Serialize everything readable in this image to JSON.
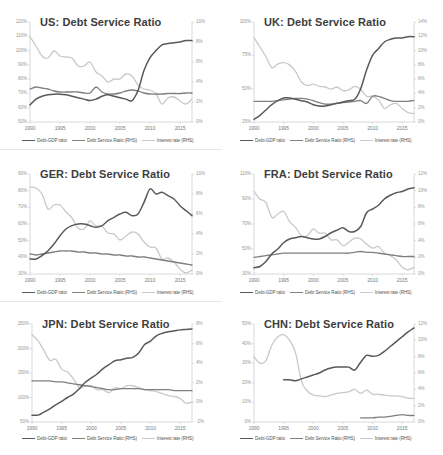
{
  "figure": {
    "panel_count": 6,
    "series_names": [
      "Debt-GDP ratio",
      "Debt Service Ratio (RHS)",
      "Interest rate (RHS)"
    ],
    "colors": {
      "debt_gdp": "#595959",
      "debt_service": "#7f7f7f",
      "interest_rate": "#c9c9c9",
      "axis": "#c9c9c9",
      "tick_text": "#9a9a9a",
      "title_text": "#3d3d3d",
      "background": "#ffffff"
    },
    "legend": {
      "position": "bottom",
      "item1": "Debt-GDP ratio",
      "item2": "Debt Service Ratio (RHS)",
      "item3": "Interest rate (RHS)"
    },
    "xticks": [
      "1990",
      "1995",
      "2000",
      "2005",
      "2010",
      "2015"
    ]
  },
  "chart_data": [
    {
      "type": "line",
      "id": "us",
      "title": "US: Debt Service Ratio",
      "xlabel": "",
      "ylabel": "",
      "grid": false,
      "legend_position": "bottom",
      "xlim": [
        1990,
        2017
      ],
      "xticks": [
        "1990",
        "1995",
        "2000",
        "2005",
        "2010",
        "2015"
      ],
      "ylim_left": [
        50,
        120
      ],
      "yticks_left": [
        "120%",
        "110%",
        "100%",
        "90%",
        "80%",
        "70%",
        "60%",
        "50%"
      ],
      "ylim_right": [
        0,
        10
      ],
      "yticks_right": [
        "10%",
        "8%",
        "6%",
        "4%",
        "2%",
        "0%"
      ],
      "x": [
        1990,
        1991,
        1992,
        1993,
        1994,
        1995,
        1996,
        1997,
        1998,
        1999,
        2000,
        2001,
        2002,
        2003,
        2004,
        2005,
        2006,
        2007,
        2008,
        2009,
        2010,
        2011,
        2012,
        2013,
        2014,
        2015,
        2016,
        2017
      ],
      "series": [
        {
          "name": "Debt-GDP ratio",
          "axis": "left",
          "color": "#595959",
          "values": [
            62,
            66,
            68,
            69,
            69.5,
            69.5,
            69,
            68,
            67,
            66,
            65,
            66,
            68,
            69,
            68,
            67,
            66,
            65,
            72,
            86,
            95,
            100,
            104,
            105,
            105.5,
            106,
            107,
            107
          ]
        },
        {
          "name": "Debt Service Ratio (RHS)",
          "axis": "right",
          "color": "#7f7f7f",
          "values": [
            3.3,
            3.5,
            3.4,
            3.3,
            3.1,
            3.0,
            3.0,
            3.0,
            3.0,
            2.9,
            2.9,
            3.5,
            3.0,
            2.8,
            2.8,
            2.9,
            3.1,
            3.2,
            3.1,
            2.9,
            2.8,
            2.8,
            2.8,
            2.85,
            2.85,
            2.85,
            2.9,
            2.9
          ]
        },
        {
          "name": "Interest rate (RHS)",
          "axis": "right",
          "color": "#c9c9c9",
          "values": [
            8.5,
            7.6,
            6.6,
            6.4,
            7.1,
            6.6,
            6.5,
            6.4,
            5.6,
            5.6,
            6.0,
            5.0,
            4.6,
            4.0,
            4.3,
            4.3,
            4.8,
            4.6,
            3.7,
            3.3,
            3.2,
            2.8,
            1.8,
            2.4,
            2.5,
            2.1,
            1.8,
            2.3
          ]
        }
      ]
    },
    {
      "type": "line",
      "id": "uk",
      "title": "UK: Debt Service Ratio",
      "xlabel": "",
      "ylabel": "",
      "grid": false,
      "legend_position": "bottom",
      "xlim": [
        1990,
        2017
      ],
      "xticks": [
        "1990",
        "1995",
        "2000",
        "2005",
        "2010",
        "2015"
      ],
      "ylim_left": [
        25,
        100
      ],
      "yticks_left": [
        "100%",
        "75%",
        "50%",
        "25%"
      ],
      "ylim_right": [
        0,
        14
      ],
      "yticks_right": [
        "14%",
        "12%",
        "10%",
        "8%",
        "6%",
        "4%",
        "2%",
        "0%"
      ],
      "x": [
        1990,
        1991,
        1992,
        1993,
        1994,
        1995,
        1996,
        1997,
        1998,
        1999,
        2000,
        2001,
        2002,
        2003,
        2004,
        2005,
        2006,
        2007,
        2008,
        2009,
        2010,
        2011,
        2012,
        2013,
        2014,
        2015,
        2016,
        2017
      ],
      "series": [
        {
          "name": "Debt-GDP ratio",
          "axis": "left",
          "color": "#595959",
          "values": [
            27,
            30,
            34,
            38,
            41,
            43,
            43,
            42,
            41,
            40,
            38,
            37,
            37,
            38,
            39,
            40,
            41,
            42,
            50,
            64,
            75,
            80,
            85,
            87,
            88,
            88,
            89,
            89
          ]
        },
        {
          "name": "Debt Service Ratio (RHS)",
          "axis": "right",
          "color": "#7f7f7f",
          "values": [
            2.9,
            2.9,
            2.9,
            2.9,
            3.0,
            3.1,
            3.2,
            3.3,
            3.3,
            3.2,
            3.0,
            2.7,
            2.5,
            2.5,
            2.6,
            2.7,
            2.8,
            2.9,
            3.0,
            2.6,
            3.6,
            3.6,
            3.3,
            3.0,
            2.9,
            2.9,
            2.9,
            3.0
          ]
        },
        {
          "name": "Interest rate (RHS)",
          "axis": "right",
          "color": "#c9c9c9",
          "values": [
            11.8,
            10.5,
            9.2,
            7.6,
            8.1,
            8.3,
            8.0,
            7.1,
            5.6,
            5.1,
            5.3,
            5.0,
            4.9,
            4.6,
            4.9,
            4.4,
            4.5,
            5.0,
            4.6,
            3.6,
            3.6,
            3.1,
            1.9,
            2.4,
            2.6,
            1.9,
            1.3,
            1.2
          ]
        }
      ]
    },
    {
      "type": "line",
      "id": "ger",
      "title": "GER: Debt Service Ratio",
      "xlabel": "",
      "ylabel": "",
      "grid": false,
      "legend_position": "bottom",
      "xlim": [
        1990,
        2017
      ],
      "xticks": [
        "1990",
        "1995",
        "2000",
        "2005",
        "2010",
        "2015"
      ],
      "ylim_left": [
        30,
        90
      ],
      "yticks_left": [
        "90%",
        "80%",
        "70%",
        "60%",
        "50%",
        "40%",
        "30%"
      ],
      "ylim_right": [
        0,
        10
      ],
      "yticks_right": [
        "10%",
        "8%",
        "6%",
        "4%",
        "2%",
        "0%"
      ],
      "x": [
        1990,
        1991,
        1992,
        1993,
        1994,
        1995,
        1996,
        1997,
        1998,
        1999,
        2000,
        2001,
        2002,
        2003,
        2004,
        2005,
        2006,
        2007,
        2008,
        2009,
        2010,
        2011,
        2012,
        2013,
        2014,
        2015,
        2016,
        2017
      ],
      "series": [
        {
          "name": "Debt-GDP ratio",
          "axis": "left",
          "color": "#595959",
          "values": [
            39,
            39,
            41,
            44,
            48,
            53,
            57,
            59,
            60,
            60,
            59,
            58,
            59,
            62,
            64,
            66,
            67,
            65,
            66,
            73,
            81,
            78,
            79,
            77,
            75,
            71,
            68,
            65
          ]
        },
        {
          "name": "Debt Service Ratio (RHS)",
          "axis": "right",
          "color": "#7f7f7f",
          "values": [
            2.0,
            1.9,
            2.0,
            2.1,
            2.2,
            2.3,
            2.3,
            2.3,
            2.2,
            2.2,
            2.1,
            2.1,
            2.0,
            2.0,
            1.9,
            1.9,
            1.8,
            1.8,
            1.7,
            1.7,
            1.6,
            1.5,
            1.4,
            1.3,
            1.2,
            1.1,
            1.0,
            0.9
          ]
        },
        {
          "name": "Interest rate (RHS)",
          "axis": "right",
          "color": "#c9c9c9",
          "values": [
            8.7,
            8.6,
            8.0,
            6.5,
            6.9,
            6.9,
            6.2,
            5.6,
            4.6,
            4.5,
            5.3,
            4.8,
            4.8,
            4.1,
            4.0,
            3.4,
            3.8,
            4.2,
            4.0,
            3.2,
            2.7,
            2.6,
            1.5,
            1.6,
            1.2,
            0.5,
            0.1,
            0.4
          ]
        }
      ]
    },
    {
      "type": "line",
      "id": "fra",
      "title": "FRA: Debt Service Ratio",
      "xlabel": "",
      "ylabel": "",
      "grid": false,
      "legend_position": "bottom",
      "xlim": [
        1990,
        2017
      ],
      "xticks": [
        "1990",
        "1995",
        "2000",
        "2005",
        "2010",
        "2015"
      ],
      "ylim_left": [
        30,
        110
      ],
      "yticks_left": [
        "110%",
        "90%",
        "70%",
        "50%",
        "30%"
      ],
      "ylim_right": [
        0,
        12
      ],
      "yticks_right": [
        "12%",
        "10%",
        "8%",
        "6%",
        "4%",
        "2%",
        "0%"
      ],
      "x": [
        1990,
        1991,
        1992,
        1993,
        1994,
        1995,
        1996,
        1997,
        1998,
        1999,
        2000,
        2001,
        2002,
        2003,
        2004,
        2005,
        2006,
        2007,
        2008,
        2009,
        2010,
        2011,
        2012,
        2013,
        2014,
        2015,
        2016,
        2017
      ],
      "series": [
        {
          "name": "Debt-GDP ratio",
          "axis": "left",
          "color": "#595959",
          "values": [
            35,
            36,
            40,
            46,
            50,
            55,
            58,
            59,
            60,
            59,
            58,
            58,
            60,
            63,
            65,
            67,
            64,
            64,
            68,
            79,
            82,
            85,
            90,
            93,
            95,
            96,
            98,
            99
          ]
        },
        {
          "name": "Debt Service Ratio (RHS)",
          "axis": "right",
          "color": "#7f7f7f",
          "values": [
            2.0,
            2.1,
            2.2,
            2.3,
            2.4,
            2.5,
            2.5,
            2.5,
            2.5,
            2.5,
            2.5,
            2.5,
            2.5,
            2.5,
            2.5,
            2.5,
            2.5,
            2.6,
            2.7,
            2.6,
            2.6,
            2.5,
            2.4,
            2.3,
            2.2,
            2.1,
            2.1,
            2.1
          ]
        },
        {
          "name": "Interest rate (RHS)",
          "axis": "right",
          "color": "#c9c9c9",
          "values": [
            9.9,
            9.0,
            8.6,
            6.8,
            7.2,
            7.5,
            6.3,
            5.6,
            4.6,
            4.6,
            5.4,
            4.9,
            4.9,
            4.1,
            4.1,
            3.4,
            3.8,
            4.3,
            4.2,
            3.6,
            3.1,
            3.3,
            2.5,
            2.2,
            1.7,
            0.8,
            0.5,
            0.8
          ]
        }
      ]
    },
    {
      "type": "line",
      "id": "jpn",
      "title": "JPN: Debt Service Ratio",
      "xlabel": "",
      "ylabel": "",
      "grid": false,
      "legend_position": "bottom",
      "xlim": [
        1990,
        2017
      ],
      "xticks": [
        "1990",
        "1995",
        "2000",
        "2005",
        "2010",
        "2015"
      ],
      "ylim_left": [
        50,
        250
      ],
      "yticks_left": [
        "250%",
        "200%",
        "150%",
        "100%",
        "50%"
      ],
      "ylim_right": [
        -2,
        8
      ],
      "yticks_right": [
        "8%",
        "6%",
        "4%",
        "2%",
        "0%",
        "-2%"
      ],
      "x": [
        1990,
        1991,
        1992,
        1993,
        1994,
        1995,
        1996,
        1997,
        1998,
        1999,
        2000,
        2001,
        2002,
        2003,
        2004,
        2005,
        2006,
        2007,
        2008,
        2009,
        2010,
        2011,
        2012,
        2013,
        2014,
        2015,
        2016,
        2017
      ],
      "series": [
        {
          "name": "Debt-GDP ratio",
          "axis": "left",
          "color": "#595959",
          "values": [
            64,
            64,
            70,
            77,
            85,
            92,
            100,
            107,
            118,
            131,
            140,
            148,
            159,
            167,
            175,
            177,
            180,
            182,
            191,
            208,
            215,
            226,
            231,
            234,
            236,
            238,
            239,
            240
          ]
        },
        {
          "name": "Debt Service Ratio (RHS)",
          "axis": "right",
          "color": "#7f7f7f",
          "values": [
            2.2,
            2.2,
            2.2,
            2.2,
            2.1,
            2.1,
            2.0,
            1.9,
            1.8,
            1.7,
            1.6,
            1.5,
            1.4,
            1.3,
            1.3,
            1.4,
            1.4,
            1.4,
            1.4,
            1.3,
            1.3,
            1.3,
            1.3,
            1.3,
            1.2,
            1.2,
            1.2,
            1.2
          ]
        },
        {
          "name": "Interest rate (RHS)",
          "axis": "right",
          "color": "#c9c9c9",
          "values": [
            6.9,
            6.3,
            5.3,
            4.3,
            4.4,
            3.4,
            3.1,
            2.4,
            1.5,
            1.7,
            1.7,
            1.3,
            1.3,
            1.0,
            1.5,
            1.4,
            1.7,
            1.7,
            1.5,
            1.3,
            1.2,
            1.1,
            0.9,
            0.7,
            0.6,
            0.4,
            -0.1,
            0.05
          ]
        }
      ]
    },
    {
      "type": "line",
      "id": "chn",
      "title": "CHN: Debt Service Ratio",
      "xlabel": "",
      "ylabel": "",
      "grid": false,
      "legend_position": "bottom",
      "xlim": [
        1990,
        2017
      ],
      "xticks": [
        "1990",
        "1995",
        "2000",
        "2005",
        "2010",
        "2015"
      ],
      "ylim_left": [
        0,
        50
      ],
      "yticks_left": [
        "50%",
        "40%",
        "30%",
        "20%",
        "10%",
        "0%"
      ],
      "ylim_right": [
        0,
        12
      ],
      "yticks_right": [
        "12%",
        "10%",
        "8%",
        "6%",
        "4%",
        "2%",
        "0%"
      ],
      "x": [
        1990,
        1991,
        1992,
        1993,
        1994,
        1995,
        1996,
        1997,
        1998,
        1999,
        2000,
        2001,
        2002,
        2003,
        2004,
        2005,
        2006,
        2007,
        2008,
        2009,
        2010,
        2011,
        2012,
        2013,
        2014,
        2015,
        2016,
        2017
      ],
      "series": [
        {
          "name": "Debt-GDP ratio",
          "axis": "left",
          "color": "#595959",
          "values": [
            null,
            null,
            null,
            null,
            null,
            21.5,
            21.5,
            21.0,
            22.0,
            23.0,
            24.0,
            25.0,
            26.5,
            27.5,
            28.0,
            28.0,
            28.0,
            26.5,
            30.5,
            34.0,
            33.5,
            34.0,
            36.0,
            38.5,
            41.0,
            43.5,
            46.0,
            48.0
          ]
        },
        {
          "name": "Debt Service Ratio (RHS)",
          "axis": "right",
          "color": "#7f7f7f",
          "values": [
            null,
            null,
            null,
            null,
            null,
            null,
            null,
            null,
            null,
            null,
            null,
            null,
            null,
            null,
            null,
            null,
            null,
            null,
            0.5,
            0.5,
            0.5,
            0.6,
            0.6,
            0.7,
            0.8,
            0.9,
            0.8,
            0.8
          ]
        },
        {
          "name": "Interest rate (RHS)",
          "axis": "right",
          "color": "#c9c9c9",
          "values": [
            8.0,
            7.2,
            7.5,
            9.4,
            10.4,
            10.7,
            10.0,
            8.5,
            5.0,
            3.8,
            3.3,
            3.2,
            3.1,
            3.3,
            3.5,
            3.6,
            3.7,
            4.0,
            3.5,
            3.9,
            3.4,
            3.4,
            3.3,
            3.2,
            3.2,
            3.1,
            2.9,
            2.9
          ]
        }
      ]
    }
  ]
}
